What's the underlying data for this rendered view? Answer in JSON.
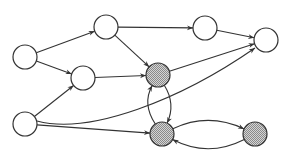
{
  "diagram": {
    "type": "directed-graph",
    "colors": {
      "stroke": "#333333",
      "plain_fill": "#ffffff",
      "shaded_fill": "#b0b0b0"
    },
    "node_radius": 12,
    "nodes": [
      {
        "id": "A",
        "x": 25,
        "y": 57,
        "shaded": false
      },
      {
        "id": "B",
        "x": 106,
        "y": 27,
        "shaded": false
      },
      {
        "id": "C",
        "x": 205,
        "y": 28,
        "shaded": false
      },
      {
        "id": "D",
        "x": 266,
        "y": 40,
        "shaded": false
      },
      {
        "id": "E",
        "x": 83,
        "y": 78,
        "shaded": false
      },
      {
        "id": "F",
        "x": 158,
        "y": 75,
        "shaded": true
      },
      {
        "id": "G",
        "x": 25,
        "y": 124,
        "shaded": false
      },
      {
        "id": "H",
        "x": 162,
        "y": 134,
        "shaded": true
      },
      {
        "id": "I",
        "x": 255,
        "y": 134,
        "shaded": true
      }
    ],
    "edges": [
      {
        "from": "A",
        "to": "B"
      },
      {
        "from": "A",
        "to": "E"
      },
      {
        "from": "B",
        "to": "C"
      },
      {
        "from": "B",
        "to": "F"
      },
      {
        "from": "C",
        "to": "D"
      },
      {
        "from": "E",
        "to": "F"
      },
      {
        "from": "F",
        "to": "D"
      },
      {
        "from": "F",
        "to": "H",
        "curved": true
      },
      {
        "from": "H",
        "to": "F",
        "curved": true
      },
      {
        "from": "G",
        "to": "E"
      },
      {
        "from": "G",
        "to": "D",
        "curved": true
      },
      {
        "from": "G",
        "to": "H"
      },
      {
        "from": "H",
        "to": "I",
        "curved": true
      },
      {
        "from": "I",
        "to": "H",
        "curved": true
      }
    ]
  }
}
